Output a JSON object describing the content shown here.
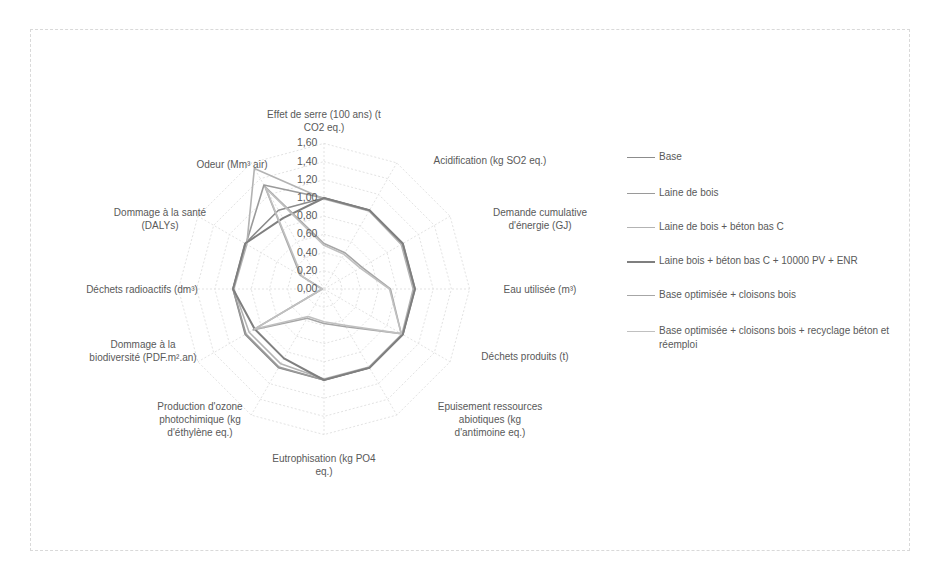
{
  "chart_data": {
    "type": "radar",
    "title": "",
    "axes": [
      "Effet de serre (100 ans) (t CO2 eq.)",
      "Acidification (kg SO2 eq.)",
      "Demande cumulative d'énergie (GJ)",
      "Eau utilisée (m³)",
      "Déchets produits (t)",
      "Epuisement ressources abiotiques (kg d'antimoine eq.)",
      "Eutrophisation (kg PO4 eq.)",
      "Production d'ozone photochimique (kg d'éthylène eq.)",
      "Dommage à la biodiversité (PDF.m².an)",
      "Déchets radioactifs (dm³)",
      "Dommage à la santé (DALYs)",
      "Odeur (Mm³ air)"
    ],
    "rlim": [
      0,
      1.6
    ],
    "ticks": [
      "0,00",
      "0,20",
      "0,40",
      "0,60",
      "0,80",
      "1,00",
      "1,20",
      "1,40",
      "1,60"
    ],
    "grid": true,
    "legend_position": "right",
    "series": [
      {
        "name": "Base",
        "color": "#8c8c8c",
        "values": [
          1.0,
          1.0,
          1.0,
          1.0,
          1.0,
          1.0,
          1.0,
          1.0,
          1.0,
          1.0,
          1.0,
          1.0
        ]
      },
      {
        "name": "Laine de bois",
        "color": "#9a9a9a",
        "values": [
          1.0,
          1.0,
          0.99,
          0.99,
          1.0,
          1.0,
          1.0,
          0.99,
          0.99,
          1.0,
          0.99,
          1.32
        ]
      },
      {
        "name": "Laine de bois + béton bas C",
        "color": "#b3b3b3",
        "values": [
          0.99,
          0.99,
          0.98,
          0.98,
          0.99,
          0.99,
          0.99,
          0.95,
          0.95,
          0.99,
          0.98,
          1.53
        ]
      },
      {
        "name": "Laine bois + béton bas C + 10000 PV + ENR",
        "color": "#7f7f7f",
        "values": [
          1.0,
          1.0,
          1.0,
          1.0,
          1.0,
          1.0,
          1.0,
          0.88,
          0.88,
          1.0,
          1.0,
          0.9
        ]
      },
      {
        "name": "Base optimisée + cloisons bois",
        "color": "#a6a6a6",
        "values": [
          0.5,
          0.46,
          0.48,
          0.73,
          0.98,
          0.48,
          0.38,
          0.37,
          0.9,
          0.02,
          0.3,
          1.3
        ]
      },
      {
        "name": "Base optimisée + cloisons bois + recyclage béton et réemploi",
        "color": "#c0c0c0",
        "values": [
          0.48,
          0.44,
          0.46,
          0.72,
          0.98,
          0.46,
          0.36,
          0.35,
          0.88,
          0.02,
          0.28,
          1.28
        ]
      }
    ]
  },
  "axis_labels": [
    [
      "Effet de serre (100 ans) (t",
      "CO2 eq.)"
    ],
    [
      "Acidification (kg SO2 eq.)"
    ],
    [
      "Demande cumulative",
      "d'énergie (GJ)"
    ],
    [
      "Eau utilisée (m³)"
    ],
    [
      "Déchets produits (t)"
    ],
    [
      "Epuisement ressources",
      "abiotiques (kg",
      "d'antimoine eq.)"
    ],
    [
      "Eutrophisation (kg PO4",
      "eq.)"
    ],
    [
      "Production d'ozone",
      "photochimique (kg",
      "d'éthylène eq.)"
    ],
    [
      "Dommage à la",
      "biodiversité (PDF.m².an)"
    ],
    [
      "Déchets radioactifs (dm³)"
    ],
    [
      "Dommage à la santé",
      "(DALYs)"
    ],
    [
      "Odeur (Mm³ air)"
    ]
  ],
  "legend": {
    "items": [
      {
        "label": "Base"
      },
      {
        "label": "Laine de bois"
      },
      {
        "label": "Laine de bois + béton bas C"
      },
      {
        "label": "Laine bois + béton bas C + 10000 PV + ENR"
      },
      {
        "label": "Base optimisée + cloisons bois"
      },
      {
        "label": "Base optimisée + cloisons bois + recyclage béton et réemploi"
      }
    ]
  }
}
